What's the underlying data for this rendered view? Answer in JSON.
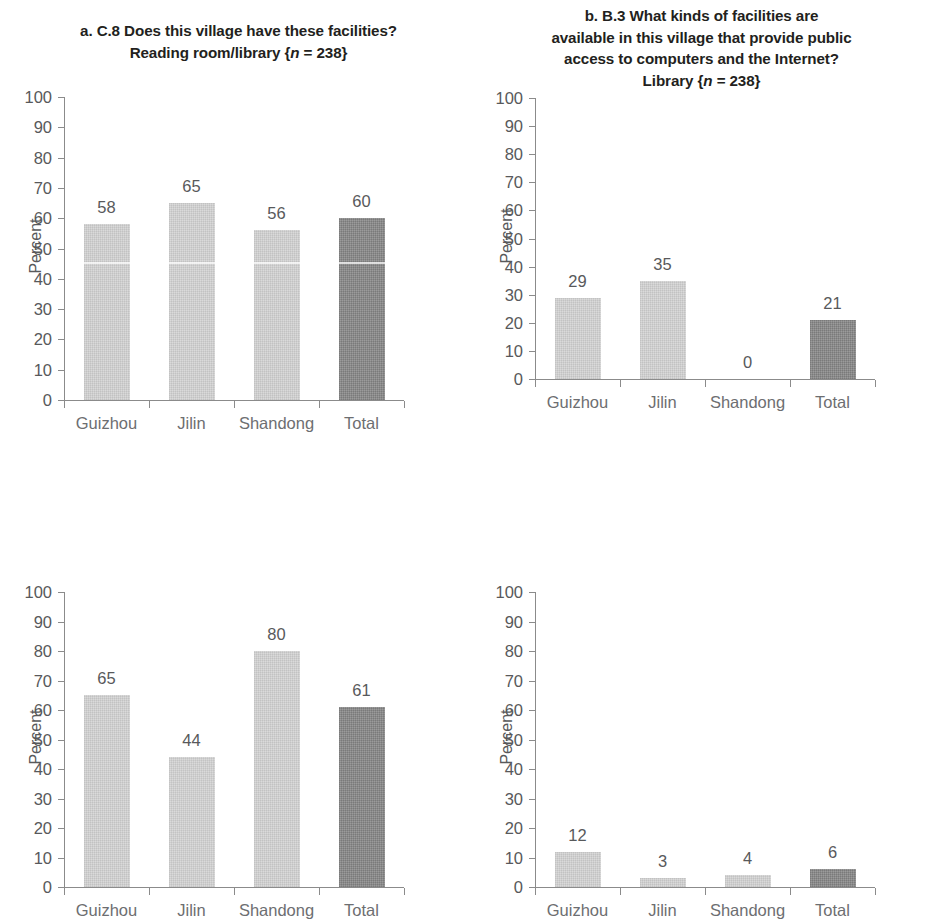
{
  "figure": {
    "panels": [
      {
        "key": "a",
        "title_lines": [
          "a. C.8 Does this village have these facilities?",
          "Reading room/library {n = 238}"
        ],
        "ylabel": "Percent"
      },
      {
        "key": "b",
        "title_lines": [
          "b. B.3 What kinds of facilities are",
          "available in this village that provide public",
          "access to computers and the Internet?",
          "Library {n = 238}"
        ],
        "ylabel": "Percent"
      },
      {
        "key": "c",
        "title_lines": [
          "c. D.5 Please enter the equipment",
          "and facilities this school has: Library",
          "(reading room) {n = 110}"
        ],
        "ylabel": "Percent"
      },
      {
        "key": "d",
        "title_lines": [
          "d. E.43 How often have you visited the",
          "respective place in the last year?",
          "(at least once) Public libraries {n = 3,060}"
        ],
        "ylabel": "Percent"
      }
    ],
    "yticks": [
      "0",
      "10",
      "20",
      "30",
      "40",
      "50",
      "60",
      "70",
      "80",
      "90",
      "100"
    ],
    "colors": {
      "bar_light": "#d6d6d6",
      "bar_dark": "#8d8d8d",
      "axis": "#8b8b8b",
      "tick_text": "#58595b",
      "category_text": "#6d6e71",
      "title_text": "#231f20",
      "background": "#ffffff"
    }
  },
  "chart_data": [
    {
      "type": "bar",
      "panel": "a",
      "title": "a. C.8 Does this village have these facilities? Reading room/library {n = 238}",
      "question_code": "C.8",
      "n": 238,
      "categories": [
        "Guizhou",
        "Jilin",
        "Shandong",
        "Total"
      ],
      "values": [
        58,
        65,
        56,
        60
      ],
      "labels": [
        "58",
        "65",
        "56",
        "60"
      ],
      "highlight_index": 3,
      "xlabel": "",
      "ylabel": "Percent",
      "ylim": [
        0,
        100
      ],
      "ytick_step": 10,
      "grid": false,
      "legend": "none"
    },
    {
      "type": "bar",
      "panel": "b",
      "title": "b. B.3 What kinds of facilities are available in this village that provide public access to computers and the Internet? Library {n = 238}",
      "question_code": "B.3",
      "n": 238,
      "categories": [
        "Guizhou",
        "Jilin",
        "Shandong",
        "Total"
      ],
      "values": [
        29,
        35,
        0,
        21
      ],
      "labels": [
        "29",
        "35",
        "0",
        "21"
      ],
      "highlight_index": 3,
      "xlabel": "",
      "ylabel": "Percent",
      "ylim": [
        0,
        100
      ],
      "ytick_step": 10,
      "grid": false,
      "legend": "none"
    },
    {
      "type": "bar",
      "panel": "c",
      "title": "c. D.5 Please enter the equipment and facilities this school has: Library (reading room) {n = 110}",
      "question_code": "D.5",
      "n": 110,
      "categories": [
        "Guizhou",
        "Jilin",
        "Shandong",
        "Total"
      ],
      "values": [
        65,
        44,
        80,
        61
      ],
      "labels": [
        "65",
        "44",
        "80",
        "61"
      ],
      "highlight_index": 3,
      "xlabel": "",
      "ylabel": "Percent",
      "ylim": [
        0,
        100
      ],
      "ytick_step": 10,
      "grid": false,
      "legend": "none"
    },
    {
      "type": "bar",
      "panel": "d",
      "title": "d. E.43 How often have you visited the respective place in the last year? (at least once) Public libraries {n = 3,060}",
      "question_code": "E.43",
      "n": 3060,
      "categories": [
        "Guizhou",
        "Jilin",
        "Shandong",
        "Total"
      ],
      "values": [
        12,
        3,
        4,
        6
      ],
      "labels": [
        "12",
        "3",
        "4",
        "6"
      ],
      "highlight_index": 3,
      "xlabel": "",
      "ylabel": "Percent",
      "ylim": [
        0,
        100
      ],
      "ytick_step": 10,
      "grid": false,
      "legend": "none"
    }
  ]
}
